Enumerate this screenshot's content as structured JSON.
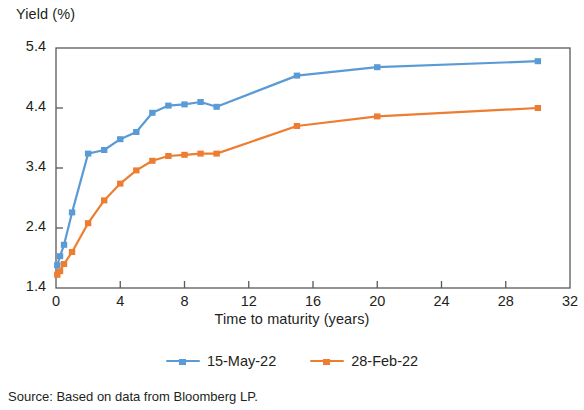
{
  "chart_data": {
    "type": "line",
    "title": "",
    "xlabel": "Time to maturity (years)",
    "ylabel": "Yield (%)",
    "xlim": [
      0,
      32
    ],
    "ylim": [
      1.4,
      5.4
    ],
    "xticks": [
      0,
      4,
      8,
      12,
      16,
      20,
      24,
      28,
      32
    ],
    "yticks": [
      1.4,
      2.4,
      3.4,
      4.4,
      5.4
    ],
    "grid": false,
    "legend_position": "bottom",
    "colors": {
      "series_1": "#5B9BD5",
      "series_2": "#ED7D31",
      "axis": "#595959",
      "text": "#231f20"
    },
    "series": [
      {
        "name": "15-May-22",
        "color": "#5B9BD5",
        "points": [
          {
            "x": 0.08,
            "y": 1.78
          },
          {
            "x": 0.25,
            "y": 1.93
          },
          {
            "x": 0.5,
            "y": 2.12
          },
          {
            "x": 1.0,
            "y": 2.66
          },
          {
            "x": 2.0,
            "y": 3.64
          },
          {
            "x": 3.0,
            "y": 3.7
          },
          {
            "x": 4.0,
            "y": 3.88
          },
          {
            "x": 5.0,
            "y": 4.0
          },
          {
            "x": 6.0,
            "y": 4.32
          },
          {
            "x": 7.0,
            "y": 4.44
          },
          {
            "x": 8.0,
            "y": 4.46
          },
          {
            "x": 9.0,
            "y": 4.5
          },
          {
            "x": 10.0,
            "y": 4.42
          },
          {
            "x": 15.0,
            "y": 4.94
          },
          {
            "x": 20.0,
            "y": 5.08
          },
          {
            "x": 30.0,
            "y": 5.18
          }
        ]
      },
      {
        "name": "28-Feb-22",
        "color": "#ED7D31",
        "points": [
          {
            "x": 0.08,
            "y": 1.62
          },
          {
            "x": 0.25,
            "y": 1.68
          },
          {
            "x": 0.5,
            "y": 1.8
          },
          {
            "x": 1.0,
            "y": 2.0
          },
          {
            "x": 2.0,
            "y": 2.48
          },
          {
            "x": 3.0,
            "y": 2.86
          },
          {
            "x": 4.0,
            "y": 3.14
          },
          {
            "x": 5.0,
            "y": 3.36
          },
          {
            "x": 6.0,
            "y": 3.52
          },
          {
            "x": 7.0,
            "y": 3.6
          },
          {
            "x": 8.0,
            "y": 3.62
          },
          {
            "x": 9.0,
            "y": 3.64
          },
          {
            "x": 10.0,
            "y": 3.64
          },
          {
            "x": 15.0,
            "y": 4.1
          },
          {
            "x": 20.0,
            "y": 4.26
          },
          {
            "x": 30.0,
            "y": 4.4
          }
        ]
      }
    ]
  },
  "labels": {
    "y_axis_title": "Yield (%)",
    "x_axis_title": "Time to maturity (years)",
    "ytick_labels": [
      "5.4",
      "4.4",
      "3.4",
      "2.4",
      "1.4"
    ],
    "xtick_labels": [
      "0",
      "4",
      "8",
      "12",
      "16",
      "20",
      "24",
      "28",
      "32"
    ],
    "legend": [
      "15-May-22",
      "28-Feb-22"
    ],
    "source": "Source: Based on data from Bloomberg LP."
  }
}
